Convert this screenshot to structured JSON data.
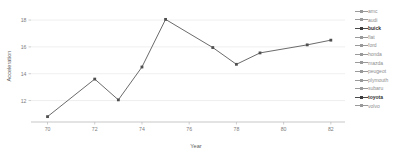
{
  "chart_data": {
    "type": "line",
    "title": "",
    "xlabel": "Year",
    "ylabel": "Acceleration",
    "x": [
      70,
      72,
      73,
      74,
      75,
      77,
      78,
      79,
      81,
      82
    ],
    "values": [
      10.8,
      13.6,
      12.05,
      14.5,
      18.05,
      15.95,
      14.7,
      15.55,
      16.15,
      16.5
    ],
    "series": [
      {
        "name": "buick",
        "x": [
          70,
          72,
          73,
          74,
          75,
          77,
          78,
          79,
          81,
          82
        ],
        "values": [
          10.8,
          13.6,
          12.05,
          14.5,
          18.05,
          15.95,
          14.7,
          15.55,
          16.15,
          16.5
        ]
      }
    ],
    "xlim": [
      69.3,
      82.6
    ],
    "ylim": [
      10.4,
      18.6
    ],
    "xticks": [
      "70",
      "72",
      "74",
      "76",
      "78",
      "80",
      "82"
    ],
    "xtick_values": [
      70,
      72,
      74,
      76,
      78,
      80,
      82
    ],
    "yticks": [
      "12",
      "14",
      "16",
      "18"
    ],
    "ytick_values": [
      12,
      14,
      16,
      18
    ],
    "grid": true,
    "grid_axis": "y",
    "legend_position": "right",
    "point_markers": true,
    "colors": {
      "line": "#6b6b6b",
      "point": "#4f4f4f",
      "grid": "#e8e8e8",
      "axis": "#b9b9b9",
      "tick_text": "#7d7d7d",
      "axis_title": "#5c5c5c",
      "legend_text": "#8d8d8d",
      "legend_active_text": "#2f2f2f"
    }
  },
  "legend": {
    "entries": [
      {
        "label": "amc",
        "active": false
      },
      {
        "label": "audi",
        "active": false
      },
      {
        "label": "buick",
        "active": true
      },
      {
        "label": "fiat",
        "active": false
      },
      {
        "label": "ford",
        "active": false
      },
      {
        "label": "honda",
        "active": false
      },
      {
        "label": "mazda",
        "active": false
      },
      {
        "label": "peugeot",
        "active": false
      },
      {
        "label": "plymouth",
        "active": false
      },
      {
        "label": "subaru",
        "active": false
      },
      {
        "label": "toyota",
        "active": true
      },
      {
        "label": "volvo",
        "active": false
      }
    ]
  }
}
